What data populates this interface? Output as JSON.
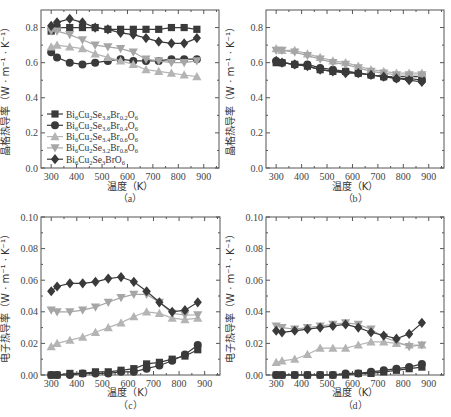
{
  "chart_data": [
    {
      "id": "a",
      "type": "line",
      "caption": "（a）",
      "xlabel": "温度（K）",
      "ylabel": "晶格热导率（W · m⁻¹ · K⁻¹）",
      "xlim": [
        260,
        960
      ],
      "ylim": [
        0.0,
        0.9
      ],
      "xticks": [
        300,
        400,
        500,
        600,
        700,
        800,
        900
      ],
      "yticks": [
        0.0,
        0.2,
        0.4,
        0.6,
        0.8
      ],
      "ytick_labels": [
        "0.0",
        "0.2",
        "0.4",
        "0.6",
        "0.8"
      ],
      "x": [
        300,
        323,
        373,
        423,
        473,
        523,
        573,
        623,
        673,
        723,
        773,
        823,
        873
      ],
      "legend": {
        "position": "lower left",
        "show": true
      },
      "series": [
        {
          "name": "Bi6Cu2Se3.8Br0.2O6",
          "marker": "square",
          "color": "#3a3a3a",
          "values": [
            0.78,
            0.8,
            0.8,
            0.8,
            0.8,
            0.79,
            0.79,
            0.79,
            0.79,
            0.79,
            0.8,
            0.8,
            0.79
          ]
        },
        {
          "name": "Bi6Cu2Se3.6Br0.4O6",
          "marker": "circle",
          "color": "#3a3a3a",
          "values": [
            0.66,
            0.63,
            0.6,
            0.59,
            0.6,
            0.61,
            0.62,
            0.61,
            0.61,
            0.61,
            0.62,
            0.62,
            0.62
          ]
        },
        {
          "name": "Bi6Cu2Se3.4Br0.6O6",
          "marker": "triangle-up",
          "color": "#b4b4b4",
          "values": [
            0.69,
            0.7,
            0.69,
            0.68,
            0.65,
            0.63,
            0.61,
            0.59,
            0.56,
            0.55,
            0.54,
            0.53,
            0.52
          ]
        },
        {
          "name": "Bi6Cu2Se3.2Br0.8O6",
          "marker": "triangle-down",
          "color": "#a6a6a6",
          "values": [
            0.78,
            0.78,
            0.76,
            0.73,
            0.7,
            0.69,
            0.68,
            0.66,
            0.62,
            0.61,
            0.6,
            0.6,
            0.61
          ]
        },
        {
          "name": "Bi6Cu2Se3BrO6",
          "marker": "diamond",
          "color": "#3a3a3a",
          "values": [
            0.81,
            0.83,
            0.85,
            0.83,
            0.8,
            0.79,
            0.77,
            0.76,
            0.74,
            0.72,
            0.71,
            0.71,
            0.74
          ]
        }
      ]
    },
    {
      "id": "b",
      "type": "line",
      "caption": "（b）",
      "xlabel": "温度（K）",
      "ylabel": "晶格热导率（W · m⁻¹ · K⁻¹）",
      "xlim": [
        260,
        960
      ],
      "ylim": [
        0.0,
        0.9
      ],
      "xticks": [
        300,
        400,
        500,
        600,
        700,
        800,
        900
      ],
      "yticks": [
        0.0,
        0.2,
        0.4,
        0.6,
        0.8
      ],
      "ytick_labels": [
        "0.0",
        "0.2",
        "0.4",
        "0.6",
        "0.8"
      ],
      "x": [
        300,
        323,
        373,
        423,
        473,
        523,
        573,
        623,
        673,
        723,
        773,
        823,
        873
      ],
      "legend": {
        "show": false
      },
      "series": [
        {
          "name": "Bi6Cu2Se3.8Br0.2O6",
          "marker": "square",
          "color": "#3a3a3a",
          "values": [
            0.6,
            0.6,
            0.59,
            0.58,
            0.56,
            0.55,
            0.55,
            0.54,
            0.53,
            0.52,
            0.52,
            0.52,
            0.52
          ]
        },
        {
          "name": "Bi6Cu2Se3.6Br0.4O6",
          "marker": "circle",
          "color": "#3a3a3a",
          "values": [
            0.61,
            0.6,
            0.59,
            0.59,
            0.57,
            0.56,
            0.55,
            0.54,
            0.53,
            0.52,
            0.51,
            0.51,
            0.5
          ]
        },
        {
          "name": "Bi6Cu2Se3.4Br0.6O6",
          "marker": "triangle-up",
          "color": "#b4b4b4",
          "values": [
            0.68,
            0.67,
            0.67,
            0.65,
            0.63,
            0.61,
            0.6,
            0.58,
            0.56,
            0.55,
            0.54,
            0.54,
            0.54
          ]
        },
        {
          "name": "Bi6Cu2Se3.2Br0.8O6",
          "marker": "triangle-down",
          "color": "#a6a6a6",
          "values": [
            0.67,
            0.67,
            0.66,
            0.64,
            0.62,
            0.6,
            0.59,
            0.57,
            0.55,
            0.54,
            0.53,
            0.53,
            0.53
          ]
        },
        {
          "name": "Bi6Cu2Se3BrO6",
          "marker": "diamond",
          "color": "#3a3a3a",
          "values": [
            0.61,
            0.6,
            0.59,
            0.58,
            0.56,
            0.55,
            0.54,
            0.54,
            0.53,
            0.52,
            0.51,
            0.5,
            0.49
          ]
        }
      ]
    },
    {
      "id": "c",
      "type": "line",
      "caption": "（c）",
      "xlabel": "温度（K）",
      "ylabel": "电子热导率（W · m⁻¹ · K⁻¹）",
      "xlim": [
        260,
        960
      ],
      "ylim": [
        0.0,
        0.1
      ],
      "xticks": [
        300,
        400,
        500,
        600,
        700,
        800,
        900
      ],
      "yticks": [
        0.0,
        0.02,
        0.04,
        0.06,
        0.08,
        0.1
      ],
      "ytick_labels": [
        "0.00",
        "0.02",
        "0.04",
        "0.06",
        "0.08",
        "0.10"
      ],
      "x": [
        300,
        323,
        373,
        423,
        473,
        523,
        573,
        623,
        673,
        723,
        773,
        823,
        873
      ],
      "legend": {
        "show": false
      },
      "series": [
        {
          "name": "Bi6Cu2Se3.8Br0.2O6",
          "marker": "square",
          "color": "#3a3a3a",
          "values": [
            0.0,
            0.0,
            0.001,
            0.001,
            0.002,
            0.002,
            0.003,
            0.004,
            0.007,
            0.008,
            0.01,
            0.012,
            0.016
          ]
        },
        {
          "name": "Bi6Cu2Se3.6Br0.4O6",
          "marker": "circle",
          "color": "#3a3a3a",
          "values": [
            0.0,
            0.0,
            0.0,
            0.001,
            0.001,
            0.001,
            0.002,
            0.002,
            0.004,
            0.006,
            0.009,
            0.013,
            0.019
          ]
        },
        {
          "name": "Bi6Cu2Se3.4Br0.6O6",
          "marker": "triangle-up",
          "color": "#b4b4b4",
          "values": [
            0.018,
            0.02,
            0.022,
            0.024,
            0.027,
            0.03,
            0.033,
            0.037,
            0.04,
            0.039,
            0.036,
            0.035,
            0.036
          ]
        },
        {
          "name": "Bi6Cu2Se3.2Br0.8O6",
          "marker": "triangle-down",
          "color": "#a6a6a6",
          "values": [
            0.041,
            0.04,
            0.04,
            0.041,
            0.043,
            0.046,
            0.049,
            0.051,
            0.051,
            0.046,
            0.039,
            0.038,
            0.038
          ]
        },
        {
          "name": "Bi6Cu2Se3BrO6",
          "marker": "diamond",
          "color": "#3a3a3a",
          "values": [
            0.053,
            0.056,
            0.058,
            0.058,
            0.059,
            0.061,
            0.062,
            0.059,
            0.053,
            0.046,
            0.04,
            0.041,
            0.046
          ]
        }
      ]
    },
    {
      "id": "d",
      "type": "line",
      "caption": "（d）",
      "xlabel": "温度（K）",
      "ylabel": "电子热导率（W · m⁻¹ · K⁻¹）",
      "xlim": [
        260,
        960
      ],
      "ylim": [
        0.0,
        0.1
      ],
      "xticks": [
        300,
        400,
        500,
        600,
        700,
        800,
        900
      ],
      "yticks": [
        0.0,
        0.02,
        0.04,
        0.06,
        0.08,
        0.1
      ],
      "ytick_labels": [
        "0.00",
        "0.02",
        "0.04",
        "0.06",
        "0.08",
        "0.10"
      ],
      "x": [
        300,
        323,
        373,
        423,
        473,
        523,
        573,
        623,
        673,
        723,
        773,
        823,
        873
      ],
      "legend": {
        "show": false
      },
      "series": [
        {
          "name": "Bi6Cu2Se3.8Br0.2O6",
          "marker": "square",
          "color": "#3a3a3a",
          "values": [
            0.0,
            0.0,
            0.0,
            0.0,
            0.0,
            0.0,
            0.0,
            0.001,
            0.001,
            0.002,
            0.003,
            0.004,
            0.005
          ]
        },
        {
          "name": "Bi6Cu2Se3.6Br0.4O6",
          "marker": "circle",
          "color": "#3a3a3a",
          "values": [
            0.0,
            0.0,
            0.0,
            0.0,
            0.0,
            0.0,
            0.001,
            0.001,
            0.002,
            0.003,
            0.004,
            0.005,
            0.007
          ]
        },
        {
          "name": "Bi6Cu2Se3.4Br0.6O6",
          "marker": "triangle-up",
          "color": "#b4b4b4",
          "values": [
            0.008,
            0.009,
            0.01,
            0.013,
            0.017,
            0.017,
            0.017,
            0.019,
            0.021,
            0.021,
            0.02,
            0.019,
            0.019
          ]
        },
        {
          "name": "Bi6Cu2Se3.2Br0.8O6",
          "marker": "triangle-down",
          "color": "#a6a6a6",
          "values": [
            0.031,
            0.03,
            0.029,
            0.03,
            0.031,
            0.032,
            0.033,
            0.032,
            0.029,
            0.024,
            0.021,
            0.018,
            0.019
          ]
        },
        {
          "name": "Bi6Cu2Se3BrO6",
          "marker": "diamond",
          "color": "#3a3a3a",
          "values": [
            0.028,
            0.027,
            0.028,
            0.029,
            0.03,
            0.031,
            0.032,
            0.03,
            0.027,
            0.025,
            0.023,
            0.026,
            0.033
          ]
        }
      ]
    }
  ],
  "legend_labels": [
    {
      "base": "Bi",
      "parts": [
        [
          "Bi",
          ""
        ],
        [
          "6",
          "sub"
        ],
        [
          "Cu",
          ""
        ],
        [
          "2",
          "sub"
        ],
        [
          "Se",
          ""
        ],
        [
          "3.8",
          "sub"
        ],
        [
          "Br",
          ""
        ],
        [
          "0.2",
          "sub"
        ],
        [
          "O",
          ""
        ],
        [
          "6",
          "sub"
        ]
      ]
    },
    {
      "base": "Bi",
      "parts": [
        [
          "Bi",
          ""
        ],
        [
          "6",
          "sub"
        ],
        [
          "Cu",
          ""
        ],
        [
          "2",
          "sub"
        ],
        [
          "Se",
          ""
        ],
        [
          "3.6",
          "sub"
        ],
        [
          "Br",
          ""
        ],
        [
          "0.4",
          "sub"
        ],
        [
          "O",
          ""
        ],
        [
          "6",
          "sub"
        ]
      ]
    },
    {
      "base": "Bi",
      "parts": [
        [
          "Bi",
          ""
        ],
        [
          "6",
          "sub"
        ],
        [
          "Cu",
          ""
        ],
        [
          "2",
          "sub"
        ],
        [
          "Se",
          ""
        ],
        [
          "3.4",
          "sub"
        ],
        [
          "Br",
          ""
        ],
        [
          "0.6",
          "sub"
        ],
        [
          "O",
          ""
        ],
        [
          "6",
          "sub"
        ]
      ]
    },
    {
      "base": "Bi",
      "parts": [
        [
          "Bi",
          ""
        ],
        [
          "6",
          "sub"
        ],
        [
          "Cu",
          ""
        ],
        [
          "2",
          "sub"
        ],
        [
          "Se",
          ""
        ],
        [
          "3.2",
          "sub"
        ],
        [
          "Br",
          ""
        ],
        [
          "0.8",
          "sub"
        ],
        [
          "O",
          ""
        ],
        [
          "6",
          "sub"
        ]
      ]
    },
    {
      "base": "Bi",
      "parts": [
        [
          "Bi",
          ""
        ],
        [
          "6",
          "sub"
        ],
        [
          "Cu",
          ""
        ],
        [
          "2",
          "sub"
        ],
        [
          "Se",
          ""
        ],
        [
          "3",
          "sub"
        ],
        [
          "BrO",
          ""
        ],
        [
          "6",
          "sub"
        ]
      ]
    }
  ]
}
